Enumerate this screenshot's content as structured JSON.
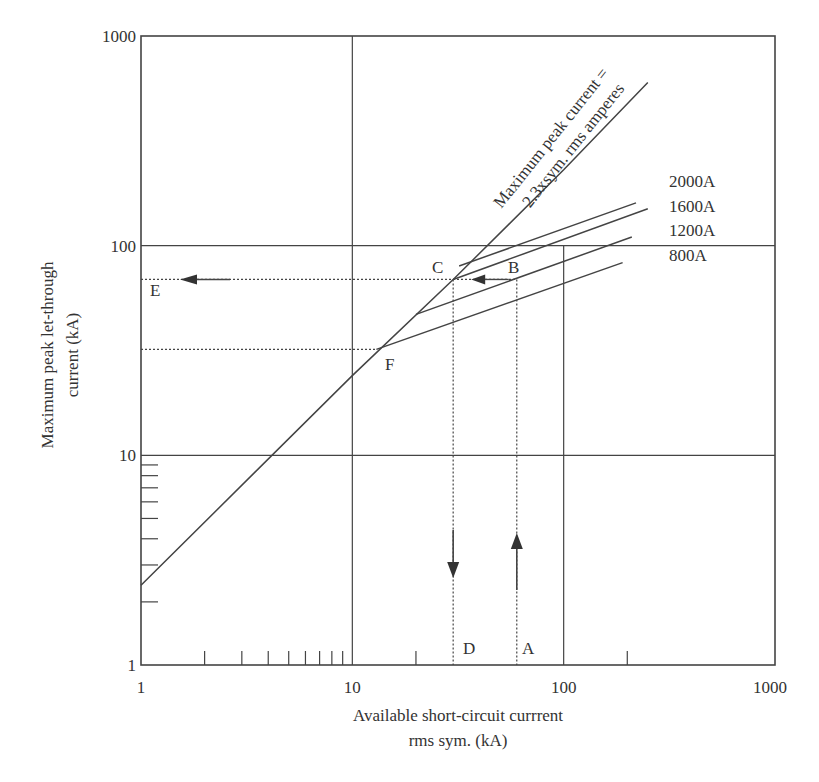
{
  "chart_data": {
    "type": "line",
    "title": "",
    "xlabel": "Available short-circuit currrent rms sym. (kA)",
    "xlabel_lines": [
      "Available short-circuit currrent",
      "rms sym. (kA)"
    ],
    "ylabel": "Maximum peak let-through current (kA)",
    "ylabel_lines": [
      "Maximum peak let-through",
      "current (kA)"
    ],
    "xscale": "log",
    "yscale": "log",
    "xlim": [
      1,
      1000
    ],
    "ylim": [
      1,
      1000
    ],
    "x_ticks": [
      "1",
      "10",
      "100",
      "1000"
    ],
    "y_ticks": [
      "1",
      "10",
      "100",
      "1000"
    ],
    "grid": true,
    "series": [
      {
        "name": "Maximum peak current = 2.3xsym. rms amperes",
        "label_lines": [
          "Maximum peak current =",
          "2.3xsym. rms amperes"
        ],
        "points": [
          [
            1,
            2.4
          ],
          [
            10,
            24
          ],
          [
            30,
            69
          ],
          [
            100,
            230
          ],
          [
            250,
            600
          ]
        ]
      },
      {
        "name": "2000A",
        "points": [
          [
            32,
            80
          ],
          [
            220,
            160
          ]
        ]
      },
      {
        "name": "1600A",
        "points": [
          [
            30,
            69
          ],
          [
            250,
            150
          ]
        ]
      },
      {
        "name": "1200A",
        "points": [
          [
            20,
            47
          ],
          [
            210,
            110
          ]
        ]
      },
      {
        "name": "800A",
        "points": [
          [
            13,
            32
          ],
          [
            190,
            83
          ]
        ]
      }
    ],
    "annotations": [
      {
        "label": "A",
        "x": 60,
        "y": 1.2,
        "note": "arrow up from A at 60 kA"
      },
      {
        "label": "B",
        "x": 60,
        "y": 69
      },
      {
        "label": "C",
        "x": 30,
        "y": 69
      },
      {
        "label": "D",
        "x": 30,
        "y": 1.2,
        "note": "arrow down to D at 30 kA"
      },
      {
        "label": "E",
        "x": 1.1,
        "y": 69,
        "note": "arrow left to E at ~69 kA"
      },
      {
        "label": "F",
        "x": 13,
        "y": 32
      }
    ]
  }
}
